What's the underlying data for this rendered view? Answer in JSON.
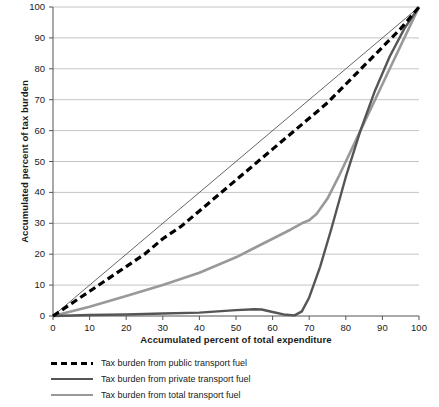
{
  "chart_data": {
    "type": "line",
    "title": "",
    "xlabel": "Accumulated percent of total expenditure",
    "ylabel": "Accumulated percent of tax burden",
    "xlim": [
      0,
      100
    ],
    "ylim": [
      0,
      100
    ],
    "xticks": [
      0,
      10,
      20,
      30,
      40,
      50,
      60,
      70,
      80,
      90,
      100
    ],
    "yticks": [
      0,
      10,
      20,
      30,
      40,
      50,
      60,
      70,
      80,
      90,
      100
    ],
    "grid": "horizontal",
    "legend_position": "below-plot",
    "series": [
      {
        "name": "Tax burden from public transport fuel",
        "style": "dashed",
        "color": "#000000",
        "width": 3.2,
        "points": [
          [
            0,
            0
          ],
          [
            5,
            4
          ],
          [
            10,
            8
          ],
          [
            15,
            12
          ],
          [
            20,
            16
          ],
          [
            25,
            20
          ],
          [
            30,
            25
          ],
          [
            35,
            29
          ],
          [
            40,
            34
          ],
          [
            45,
            39
          ],
          [
            50,
            44
          ],
          [
            55,
            49
          ],
          [
            60,
            54
          ],
          [
            65,
            59
          ],
          [
            70,
            64
          ],
          [
            75,
            69
          ],
          [
            80,
            75
          ],
          [
            85,
            81
          ],
          [
            90,
            87
          ],
          [
            95,
            93
          ],
          [
            100,
            100
          ]
        ]
      },
      {
        "name": "Tax burden from private transport fuel",
        "style": "solid",
        "color": "#555555",
        "width": 2.4,
        "points": [
          [
            0,
            0
          ],
          [
            10,
            0.3
          ],
          [
            20,
            0.5
          ],
          [
            30,
            0.8
          ],
          [
            40,
            1.1
          ],
          [
            45,
            1.5
          ],
          [
            50,
            1.9
          ],
          [
            55,
            2.2
          ],
          [
            57,
            2.1
          ],
          [
            60,
            1.3
          ],
          [
            63,
            0.5
          ],
          [
            66,
            0.2
          ],
          [
            68,
            1.5
          ],
          [
            70,
            6
          ],
          [
            73,
            16
          ],
          [
            76,
            28
          ],
          [
            80,
            45
          ],
          [
            84,
            60
          ],
          [
            88,
            73
          ],
          [
            92,
            84
          ],
          [
            96,
            93
          ],
          [
            100,
            100
          ]
        ]
      },
      {
        "name": "Tax burden from total transport fuel",
        "style": "solid",
        "color": "#999999",
        "width": 2.6,
        "points": [
          [
            0,
            0
          ],
          [
            10,
            3
          ],
          [
            20,
            6.5
          ],
          [
            30,
            10
          ],
          [
            40,
            14
          ],
          [
            50,
            19
          ],
          [
            55,
            22
          ],
          [
            60,
            25
          ],
          [
            65,
            28
          ],
          [
            68,
            30
          ],
          [
            70,
            31
          ],
          [
            72,
            33
          ],
          [
            75,
            38
          ],
          [
            78,
            45
          ],
          [
            80,
            50
          ],
          [
            84,
            60
          ],
          [
            88,
            70
          ],
          [
            92,
            80
          ],
          [
            96,
            90
          ],
          [
            100,
            100
          ]
        ]
      }
    ],
    "reference_line": {
      "name": "equality-line",
      "color": "#555555",
      "width": 0.9,
      "points": [
        [
          0,
          0
        ],
        [
          100,
          100
        ]
      ]
    }
  },
  "legend": {
    "items": [
      {
        "label": "Tax burden from public transport fuel"
      },
      {
        "label": "Tax burden from private transport fuel"
      },
      {
        "label": "Tax burden from total transport fuel"
      }
    ]
  }
}
